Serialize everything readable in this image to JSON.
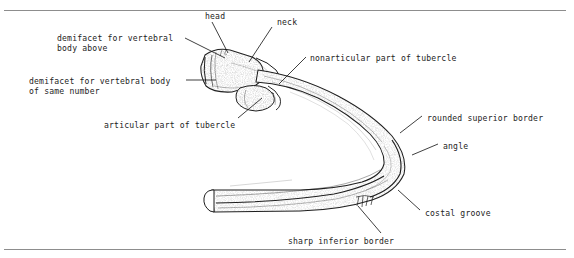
{
  "figure": {
    "name": "rib-anatomy-diagram",
    "background_color": "#ffffff",
    "ink_color": "#1d1d1d",
    "rule_color": "#8d8d8d"
  },
  "labels": [
    {
      "id": "head",
      "text": "head",
      "x": 205,
      "y": 11
    },
    {
      "id": "neck",
      "text": "neck",
      "x": 277,
      "y": 17
    },
    {
      "id": "demifacet_above",
      "text": "demifacet for vertebral\nbody above",
      "x": 57,
      "y": 33
    },
    {
      "id": "nonarticular_tubercle",
      "text": "nonarticular part of tubercle",
      "x": 310,
      "y": 53
    },
    {
      "id": "demifacet_same",
      "text": "demifacet for vertebral body\nof same number",
      "x": 29,
      "y": 76
    },
    {
      "id": "articular_tubercle",
      "text": "articular part of tubercle",
      "x": 104,
      "y": 120
    },
    {
      "id": "rounded_superior_border",
      "text": "rounded superior border",
      "x": 427,
      "y": 113
    },
    {
      "id": "angle",
      "text": "angle",
      "x": 443,
      "y": 141
    },
    {
      "id": "costal_groove",
      "text": "costal groove",
      "x": 425,
      "y": 208
    },
    {
      "id": "sharp_inferior_border",
      "text": "sharp inferior border",
      "x": 288,
      "y": 236
    }
  ],
  "leaders": [
    {
      "id": "leader-head",
      "from": [
        212,
        22
      ],
      "to": [
        228,
        53
      ]
    },
    {
      "id": "leader-neck",
      "from": [
        272,
        27
      ],
      "to": [
        249,
        62
      ]
    },
    {
      "id": "leader-demifacet-above",
      "from": [
        185,
        38
      ],
      "to": [
        225,
        58
      ]
    },
    {
      "id": "leader-nonarticular",
      "from": [
        306,
        57
      ],
      "to": [
        279,
        84
      ]
    },
    {
      "id": "leader-demifacet-same",
      "from": [
        186,
        80
      ],
      "to": [
        216,
        80
      ]
    },
    {
      "id": "leader-articular",
      "from": [
        238,
        118
      ],
      "to": [
        262,
        98
      ]
    },
    {
      "id": "leader-superior-border",
      "from": [
        422,
        116
      ],
      "to": [
        400,
        133
      ]
    },
    {
      "id": "leader-angle",
      "from": [
        438,
        144
      ],
      "to": [
        412,
        155
      ]
    },
    {
      "id": "leader-costal-groove",
      "from": [
        420,
        210
      ],
      "to": [
        398,
        190
      ]
    },
    {
      "id": "leader-inferior-border",
      "from": [
        381,
        233
      ],
      "to": [
        358,
        206
      ]
    }
  ]
}
